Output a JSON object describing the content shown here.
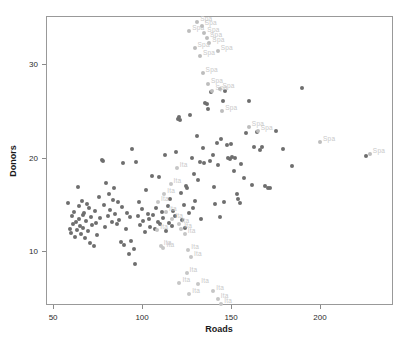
{
  "chart_data": {
    "type": "scatter",
    "title": "",
    "xlabel": "Roads",
    "ylabel": "Donors",
    "xlim": [
      46.0,
      241.0
    ],
    "ylim": [
      4.2,
      35.2
    ],
    "xticks": [
      50,
      100,
      150,
      200
    ],
    "yticks": [
      10,
      20,
      30
    ],
    "grid": false,
    "legend": null,
    "point_color": "#6e6e6e",
    "highlight_color": "#c3c3c3",
    "label_color": "#c9c9c9",
    "frame_color": "#999999",
    "series": [
      {
        "name": "countries",
        "label": "",
        "color": "#6e6e6e",
        "labelled": false,
        "points": [
          [
            58.2,
            15.1
          ],
          [
            59.4,
            12.4
          ],
          [
            60.1,
            11.9
          ],
          [
            60.8,
            13.7
          ],
          [
            61.3,
            12.9
          ],
          [
            61.9,
            14.2
          ],
          [
            62.4,
            11.5
          ],
          [
            62.9,
            13.1
          ],
          [
            63.4,
            12.2
          ],
          [
            63.9,
            16.9
          ],
          [
            64.3,
            14.8
          ],
          [
            64.8,
            13.4
          ],
          [
            65.2,
            12.7
          ],
          [
            65.7,
            11.8
          ],
          [
            66.1,
            15.4
          ],
          [
            66.6,
            13.9
          ],
          [
            67.0,
            12.5
          ],
          [
            67.5,
            14.1
          ],
          [
            68.0,
            11.4
          ],
          [
            68.5,
            13.2
          ],
          [
            69.1,
            15.0
          ],
          [
            69.6,
            12.1
          ],
          [
            70.2,
            14.6
          ],
          [
            70.8,
            10.9
          ],
          [
            71.4,
            13.6
          ],
          [
            72.0,
            12.8
          ],
          [
            72.7,
            10.5
          ],
          [
            73.4,
            14.3
          ],
          [
            74.1,
            13.0
          ],
          [
            74.9,
            11.7
          ],
          [
            75.7,
            15.8
          ],
          [
            76.4,
            13.5
          ],
          [
            77.2,
            19.8
          ],
          [
            77.9,
            19.6
          ],
          [
            78.6,
            14.9
          ],
          [
            79.2,
            12.6
          ],
          [
            79.9,
            17.3
          ],
          [
            80.6,
            13.8
          ],
          [
            81.4,
            16.1
          ],
          [
            82.1,
            14.4
          ],
          [
            82.9,
            13.1
          ],
          [
            83.6,
            15.5
          ],
          [
            84.3,
            16.7
          ],
          [
            85.0,
            14.0
          ],
          [
            85.7,
            12.9
          ],
          [
            86.4,
            15.2
          ],
          [
            87.1,
            13.3
          ],
          [
            87.9,
            11.0
          ],
          [
            88.6,
            14.7
          ],
          [
            89.4,
            19.4
          ],
          [
            90.1,
            10.6
          ],
          [
            90.9,
            12.4
          ],
          [
            91.6,
            14.1
          ],
          [
            92.4,
            9.7
          ],
          [
            93.1,
            13.6
          ],
          [
            93.9,
            11.1
          ],
          [
            94.6,
            20.9
          ],
          [
            95.3,
            10.2
          ],
          [
            96.0,
            8.6
          ],
          [
            96.8,
            19.5
          ],
          [
            97.5,
            13.7
          ],
          [
            98.3,
            15.3
          ],
          [
            99.1,
            12.8
          ],
          [
            99.9,
            14.5
          ],
          [
            100.7,
            13.2
          ],
          [
            101.5,
            12.0
          ],
          [
            102.3,
            16.5
          ],
          [
            103.1,
            14.0
          ],
          [
            103.9,
            13.4
          ],
          [
            104.7,
            12.6
          ],
          [
            105.5,
            18.0
          ],
          [
            106.3,
            13.9
          ],
          [
            107.1,
            12.3
          ],
          [
            107.9,
            14.6
          ],
          [
            108.7,
            13.1
          ],
          [
            109.5,
            17.9
          ],
          [
            110.3,
            12.9
          ],
          [
            111.1,
            14.2
          ],
          [
            111.9,
            13.5
          ],
          [
            112.7,
            20.3
          ],
          [
            113.5,
            12.1
          ],
          [
            114.3,
            14.8
          ],
          [
            115.1,
            13.0
          ],
          [
            115.9,
            15.6
          ],
          [
            116.7,
            12.7
          ],
          [
            117.5,
            14.3
          ],
          [
            118.3,
            13.8
          ],
          [
            119.1,
            20.6
          ],
          [
            119.9,
            24.2
          ],
          [
            120.5,
            24.4
          ],
          [
            121.2,
            24.0
          ],
          [
            121.9,
            16.2
          ],
          [
            122.6,
            13.3
          ],
          [
            123.3,
            14.9
          ],
          [
            124.0,
            12.5
          ],
          [
            124.8,
            17.0
          ],
          [
            125.5,
            16.8
          ],
          [
            126.3,
            14.1
          ],
          [
            127.0,
            24.6
          ],
          [
            127.8,
            20.0
          ],
          [
            128.5,
            14.6
          ],
          [
            129.3,
            18.3
          ],
          [
            130.0,
            15.4
          ],
          [
            130.8,
            22.3
          ],
          [
            131.6,
            17.6
          ],
          [
            132.4,
            19.5
          ],
          [
            133.2,
            13.4
          ],
          [
            134.0,
            21.0
          ],
          [
            134.8,
            19.4
          ],
          [
            135.6,
            25.9
          ],
          [
            136.4,
            25.8
          ],
          [
            137.2,
            25.2
          ],
          [
            138.0,
            19.6
          ],
          [
            138.8,
            27.0
          ],
          [
            139.6,
            20.3
          ],
          [
            140.4,
            16.9
          ],
          [
            141.2,
            15.0
          ],
          [
            142.0,
            21.6
          ],
          [
            142.8,
            19.2
          ],
          [
            143.6,
            13.6
          ],
          [
            144.4,
            22.0
          ],
          [
            145.2,
            26.1
          ],
          [
            146.0,
            15.2
          ],
          [
            146.8,
            27.2
          ],
          [
            147.6,
            21.4
          ],
          [
            148.4,
            20.0
          ],
          [
            149.2,
            19.9
          ],
          [
            150.0,
            21.5
          ],
          [
            150.8,
            20.1
          ],
          [
            151.6,
            18.6
          ],
          [
            152.4,
            20.0
          ],
          [
            153.2,
            16.1
          ],
          [
            154.0,
            15.6
          ],
          [
            154.8,
            15.1
          ],
          [
            155.6,
            19.3
          ],
          [
            157.0,
            17.8
          ],
          [
            158.5,
            22.6
          ],
          [
            160.0,
            26.1
          ],
          [
            161.5,
            17.1
          ],
          [
            163.0,
            21.2
          ],
          [
            164.5,
            22.8
          ],
          [
            166.0,
            20.8
          ],
          [
            167.5,
            21.2
          ],
          [
            169.0,
            17.0
          ],
          [
            170.5,
            16.8
          ],
          [
            172.0,
            16.8
          ],
          [
            175.0,
            22.9
          ],
          [
            179.0,
            20.9
          ],
          [
            184.0,
            19.1
          ],
          [
            190.0,
            27.5
          ],
          [
            226.0,
            20.2
          ]
        ]
      },
      {
        "name": "spain_trail",
        "label": "Spa",
        "color": "#bdbdbd",
        "labelled": true,
        "points": [
          [
            126.5,
            33.6
          ],
          [
            131.0,
            34.6
          ],
          [
            133.5,
            34.1
          ],
          [
            135.0,
            33.4
          ],
          [
            136.5,
            32.8
          ],
          [
            137.8,
            32.3
          ],
          [
            129.5,
            31.8
          ],
          [
            132.5,
            30.9
          ],
          [
            142.5,
            31.4
          ],
          [
            134.0,
            29.1
          ],
          [
            137.0,
            27.9
          ],
          [
            139.5,
            27.2
          ],
          [
            143.5,
            27.4
          ],
          [
            145.0,
            25.0
          ],
          [
            160.0,
            23.3
          ],
          [
            165.0,
            22.9
          ],
          [
            200.0,
            21.7
          ],
          [
            228.0,
            20.4
          ]
        ]
      },
      {
        "name": "italy_trail",
        "label": "Ita",
        "color": "#c6c6c6",
        "labelled": true,
        "points": [
          [
            119.5,
            18.9
          ],
          [
            116.0,
            17.2
          ],
          [
            112.5,
            16.1
          ],
          [
            109.0,
            15.2
          ],
          [
            113.5,
            14.2
          ],
          [
            117.0,
            13.4
          ],
          [
            120.5,
            12.9
          ],
          [
            122.0,
            12.3
          ],
          [
            124.0,
            11.8
          ],
          [
            108.5,
            12.2
          ],
          [
            110.5,
            10.5
          ],
          [
            112.0,
            10.3
          ],
          [
            126.0,
            10.1
          ],
          [
            127.5,
            9.4
          ],
          [
            125.0,
            7.6
          ],
          [
            121.0,
            6.6
          ],
          [
            126.5,
            5.4
          ],
          [
            131.5,
            6.4
          ],
          [
            140.0,
            5.7
          ],
          [
            142.5,
            4.8
          ],
          [
            144.5,
            4.3
          ]
        ]
      }
    ]
  }
}
